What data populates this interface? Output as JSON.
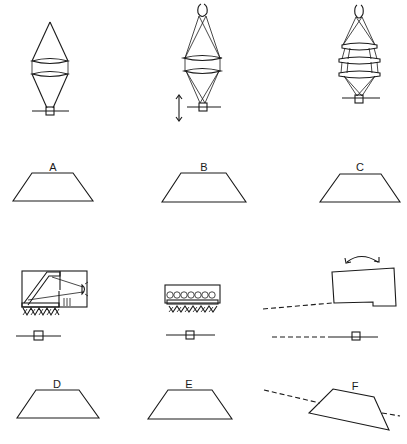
{
  "figure": {
    "panels": [
      {
        "id": "A",
        "label": "A",
        "illustration": "single-cone-two-lenses"
      },
      {
        "id": "B",
        "label": "B",
        "illustration": "crossed-beams-two-lenses-with-focus-arrow"
      },
      {
        "id": "C",
        "label": "C",
        "illustration": "crossed-beams-three-lenses"
      },
      {
        "id": "D",
        "label": "D",
        "illustration": "lamp-housing-with-mirror"
      },
      {
        "id": "E",
        "label": "E",
        "illustration": "array-of-light-sources"
      },
      {
        "id": "F",
        "label": "F",
        "illustration": "tilted-block-with-rotation-arrow"
      }
    ],
    "colors": {
      "ink": "#1a1a1a",
      "background": "#ffffff"
    }
  }
}
